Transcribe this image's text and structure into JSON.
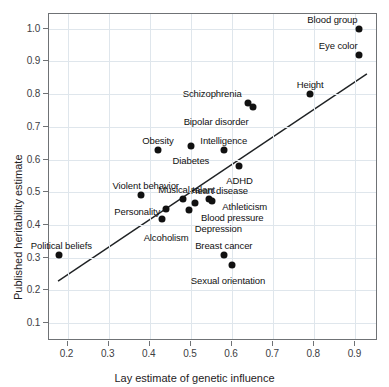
{
  "chart_data": {
    "type": "scatter",
    "title": "",
    "xlabel": "Lay estimate of genetic influence",
    "ylabel": "Published heritability estimate",
    "xlim": [
      0.155,
      0.955
    ],
    "ylim": [
      0.045,
      1.045
    ],
    "xticks": [
      "0.2",
      "0.3",
      "0.4",
      "0.5",
      "0.6",
      "0.7",
      "0.8",
      "0.9"
    ],
    "xtick_values": [
      0.2,
      0.3,
      0.4,
      0.5,
      0.6,
      0.7,
      0.8,
      0.9
    ],
    "yticks": [
      "0.1",
      "0.2",
      "0.3",
      "0.4",
      "0.5",
      "0.6",
      "0.7",
      "0.8",
      "0.9",
      "1.0"
    ],
    "ytick_values": [
      0.1,
      0.2,
      0.3,
      0.4,
      0.5,
      0.6,
      0.7,
      0.8,
      0.9,
      1.0
    ],
    "grid": true,
    "legend": "none",
    "marker_color": "#111111",
    "grid_color": "#dfe6ec",
    "axis_color": "#6f7275",
    "trendline": {
      "x0": 0.177,
      "y0": 0.228,
      "x1": 0.928,
      "y1": 0.862,
      "color": "#1f2224"
    },
    "points": [
      {
        "label": "Blood group",
        "x": 0.91,
        "y": 1.0,
        "label_dx": -2,
        "label_dy": -10,
        "anchor": "end"
      },
      {
        "label": "Eye color",
        "x": 0.91,
        "y": 0.92,
        "label_dx": -2,
        "label_dy": -10,
        "anchor": "end"
      },
      {
        "label": "Height",
        "x": 0.79,
        "y": 0.8,
        "label_dx": 0,
        "label_dy": -10,
        "anchor": "mid"
      },
      {
        "label": "Schizophrenia",
        "x": 0.638,
        "y": 0.772,
        "label_dx": -6,
        "label_dy": -10,
        "anchor": "end"
      },
      {
        "label": "Bipolar disorder",
        "x": 0.65,
        "y": 0.76,
        "label_dx": -4,
        "label_dy": 14,
        "anchor": "end"
      },
      {
        "label": "Intelligence",
        "x": 0.58,
        "y": 0.63,
        "label_dx": 0,
        "label_dy": -10,
        "anchor": "mid"
      },
      {
        "label": "Obesity",
        "x": 0.42,
        "y": 0.63,
        "label_dx": 0,
        "label_dy": -10,
        "anchor": "mid"
      },
      {
        "label": "Diabetes",
        "x": 0.5,
        "y": 0.64,
        "label_dx": 0,
        "label_dy": 14,
        "anchor": "mid"
      },
      {
        "label": "ADHD",
        "x": 0.618,
        "y": 0.58,
        "label_dx": 0,
        "label_dy": 14,
        "anchor": "mid"
      },
      {
        "label": "Violent behavior",
        "x": 0.378,
        "y": 0.49,
        "label_dx": 5,
        "label_dy": -10,
        "anchor": "mid"
      },
      {
        "label": "Musical talent",
        "x": 0.48,
        "y": 0.48,
        "label_dx": 4,
        "label_dy": -10,
        "anchor": "mid"
      },
      {
        "label": "Heart disease",
        "x": 0.545,
        "y": 0.478,
        "label_dx": 10,
        "label_dy": -9,
        "anchor": "mid"
      },
      {
        "label": "Athleticism",
        "x": 0.552,
        "y": 0.472,
        "label_dx": 10,
        "label_dy": 5,
        "anchor": "start"
      },
      {
        "label": "Personality",
        "x": 0.44,
        "y": 0.45,
        "label_dx": -6,
        "label_dy": 2,
        "anchor": "end"
      },
      {
        "label": "Blood pressure",
        "x": 0.51,
        "y": 0.467,
        "label_dx": 6,
        "label_dy": 14,
        "anchor": "start"
      },
      {
        "label": "Depression",
        "x": 0.495,
        "y": 0.447,
        "label_dx": 6,
        "label_dy": 18,
        "anchor": "start"
      },
      {
        "label": "Alcoholism",
        "x": 0.43,
        "y": 0.418,
        "label_dx": 4,
        "label_dy": 18,
        "anchor": "mid"
      },
      {
        "label": "Political beliefs",
        "x": 0.18,
        "y": 0.308,
        "label_dx": 2,
        "label_dy": -10,
        "anchor": "mid"
      },
      {
        "label": "Breast cancer",
        "x": 0.58,
        "y": 0.308,
        "label_dx": 0,
        "label_dy": -10,
        "anchor": "mid"
      },
      {
        "label": "Sexual orientation",
        "x": 0.6,
        "y": 0.278,
        "label_dx": -4,
        "label_dy": 15,
        "anchor": "mid"
      }
    ]
  }
}
